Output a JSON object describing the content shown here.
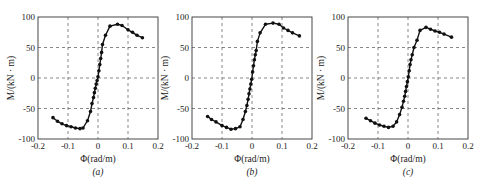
{
  "figure": {
    "captions": [
      "(a)",
      "(b)",
      "(c)"
    ]
  },
  "chart_data": [
    {
      "type": "line",
      "panel": "(a)",
      "title": "",
      "xlabel": "Φ(rad/m)",
      "ylabel": "M/(kN · m)",
      "xlim": [
        -0.2,
        0.2
      ],
      "ylim": [
        -100,
        100
      ],
      "xticks": [
        -0.2,
        -0.1,
        0,
        0.1,
        0.2
      ],
      "xtick_labels": [
        "-0.2",
        "-0.1",
        "0",
        "0.1",
        "0.2"
      ],
      "yticks": [
        -100,
        -50,
        0,
        50,
        100
      ],
      "ytick_labels": [
        "-100",
        "-50",
        "0",
        "50",
        "100"
      ],
      "grid": "dashed",
      "marker": "circle",
      "x": [
        -0.15,
        -0.135,
        -0.12,
        -0.105,
        -0.09,
        -0.075,
        -0.06,
        -0.05,
        -0.035,
        -0.025,
        -0.02,
        -0.015,
        -0.012,
        -0.009,
        -0.006,
        -0.003,
        0,
        0.003,
        0.006,
        0.009,
        0.012,
        0.015,
        0.025,
        0.04,
        0.065,
        0.08,
        0.1,
        0.115,
        0.13,
        0.148
      ],
      "y": [
        -65,
        -71,
        -75,
        -78,
        -80,
        -82,
        -83,
        -82,
        -70,
        -55,
        -42,
        -32,
        -24,
        -17,
        -10,
        -4,
        2,
        12,
        22,
        32,
        42,
        55,
        70,
        85,
        88,
        86,
        79,
        75,
        70,
        66
      ]
    },
    {
      "type": "line",
      "panel": "(b)",
      "title": "",
      "xlabel": "Φ(rad/m)",
      "ylabel": "M/(kN · m)",
      "xlim": [
        -0.2,
        0.2
      ],
      "ylim": [
        -100,
        100
      ],
      "xticks": [
        -0.2,
        -0.1,
        0,
        0.1,
        0.2
      ],
      "xtick_labels": [
        "-0.2",
        "-0.1",
        "0",
        "0.1",
        "0.2"
      ],
      "yticks": [
        -100,
        -50,
        0,
        50,
        100
      ],
      "ytick_labels": [
        "-100",
        "-50",
        "0",
        "50",
        "100"
      ],
      "grid": "dashed",
      "marker": "circle",
      "x": [
        -0.148,
        -0.135,
        -0.12,
        -0.1,
        -0.085,
        -0.07,
        -0.055,
        -0.04,
        -0.03,
        -0.022,
        -0.017,
        -0.013,
        -0.01,
        -0.007,
        -0.004,
        -0.001,
        0.002,
        0.005,
        0.008,
        0.011,
        0.014,
        0.018,
        0.027,
        0.045,
        0.07,
        0.09,
        0.105,
        0.12,
        0.135,
        0.158
      ],
      "y": [
        -63,
        -68,
        -72,
        -78,
        -81,
        -84,
        -83,
        -80,
        -68,
        -55,
        -45,
        -35,
        -26,
        -18,
        -10,
        -2,
        10,
        20,
        30,
        38,
        45,
        60,
        74,
        88,
        90,
        88,
        82,
        78,
        74,
        69
      ]
    },
    {
      "type": "line",
      "panel": "(c)",
      "title": "",
      "xlabel": "Φ(rad/m)",
      "ylabel": "M/(kN · m)",
      "xlim": [
        -0.2,
        0.2
      ],
      "ylim": [
        -100,
        100
      ],
      "xticks": [
        -0.2,
        -0.1,
        0,
        0.1,
        0.2
      ],
      "xtick_labels": [
        "-0.2",
        "-0.1",
        "0",
        "0.1",
        "0.2"
      ],
      "yticks": [
        -100,
        -50,
        0,
        50,
        100
      ],
      "ytick_labels": [
        "-100",
        "-50",
        "0",
        "50",
        "100"
      ],
      "grid": "dashed",
      "marker": "circle",
      "x": [
        -0.14,
        -0.125,
        -0.11,
        -0.095,
        -0.08,
        -0.065,
        -0.05,
        -0.038,
        -0.028,
        -0.02,
        -0.015,
        -0.011,
        -0.008,
        -0.005,
        -0.002,
        0.001,
        0.004,
        0.007,
        0.01,
        0.014,
        0.02,
        0.03,
        0.04,
        0.06,
        0.075,
        0.09,
        0.105,
        0.12,
        0.145
      ],
      "y": [
        -66,
        -70,
        -74,
        -77,
        -79,
        -81,
        -79,
        -72,
        -60,
        -48,
        -38,
        -30,
        -22,
        -14,
        -6,
        2,
        12,
        22,
        30,
        38,
        50,
        62,
        78,
        83,
        80,
        77,
        75,
        72,
        67
      ]
    }
  ],
  "layout": {
    "panels": [
      {
        "left": 38,
        "top": 17,
        "right": 158,
        "bottom": 139
      },
      {
        "left": 192,
        "top": 17,
        "right": 312,
        "bottom": 139
      },
      {
        "left": 348,
        "top": 17,
        "right": 468,
        "bottom": 139
      }
    ]
  }
}
